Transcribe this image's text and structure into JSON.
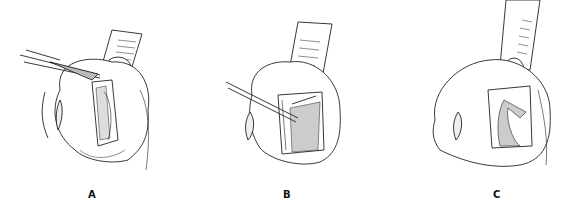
{
  "figure": {
    "panels": [
      {
        "label": "A",
        "description": "Forceps grasping tissue flap with retractor above"
      },
      {
        "label": "B",
        "description": "Probe instrument inserted into incision with retractor"
      },
      {
        "label": "C",
        "description": "Folded tissue flap in opening with retractor"
      }
    ]
  }
}
